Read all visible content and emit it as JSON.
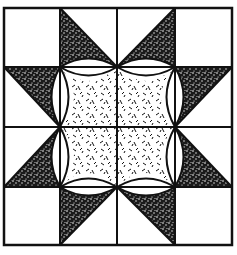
{
  "figure": {
    "title": "",
    "colors": {
      "background": "#ffffff",
      "ink": "#111111",
      "dark_fill": "#1a1a1a"
    },
    "grid": {
      "x": [
        4,
        60,
        117,
        175,
        232
      ],
      "y": [
        8,
        67,
        127,
        187,
        245
      ]
    }
  }
}
